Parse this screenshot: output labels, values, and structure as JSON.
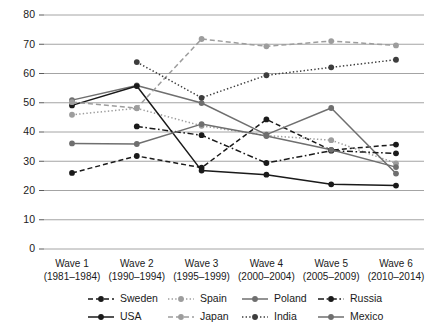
{
  "chart_data": {
    "type": "line",
    "title": "",
    "subtitle": "",
    "xlabel": "",
    "ylabel": "",
    "ylim": [
      0,
      80
    ],
    "ytick_step": 10,
    "yticks": [
      0,
      10,
      20,
      30,
      40,
      50,
      60,
      70,
      80
    ],
    "grid": "horizontal",
    "legend_position": "bottom",
    "categories": [
      "Wave 1",
      "Wave 2",
      "Wave 3",
      "Wave 4",
      "Wave 5",
      "Wave 6"
    ],
    "category_sublabels": [
      "(1981–1984)",
      "(1990–1994)",
      "(1995–1999)",
      "(2000–2004)",
      "(2005–2009)",
      "(2010–2014)"
    ],
    "series": [
      {
        "name": "Sweden",
        "color": "#1a1a1a",
        "dash": "dashed",
        "values": [
          26,
          31.8,
          27.8,
          44.3,
          33.8,
          35.7
        ]
      },
      {
        "name": "Spain",
        "color": "#9d9d9d",
        "dash": "dotted",
        "values": [
          45.9,
          48.1,
          42.1,
          38.8,
          37.2,
          29.3
        ]
      },
      {
        "name": "Poland",
        "color": "#6f6f6f",
        "dash": "solid",
        "values": [
          50.9,
          55.9,
          49.9,
          39.1,
          48.2,
          25.8
        ]
      },
      {
        "name": "Russia",
        "color": "#1a1a1a",
        "dash": "dashdot",
        "values": [
          null,
          41.9,
          38.9,
          29.4,
          33.6,
          32.7
        ]
      },
      {
        "name": "USA",
        "color": "#1a1a1a",
        "dash": "solid",
        "values": [
          49.1,
          55.7,
          26.8,
          25.4,
          22.1,
          21.7
        ]
      },
      {
        "name": "Japan",
        "color": "#9d9d9d",
        "dash": "dashed",
        "values": [
          50.2,
          48.2,
          71.8,
          69.3,
          71.1,
          69.6
        ]
      },
      {
        "name": "India",
        "color": "#3d3d3d",
        "dash": "dotted",
        "values": [
          null,
          63.9,
          51.7,
          59.4,
          62.1,
          64.7
        ]
      },
      {
        "name": "Mexico",
        "color": "#6f6f6f",
        "dash": "solid",
        "values": [
          36.1,
          35.9,
          42.7,
          38.6,
          33.9,
          28.0
        ]
      }
    ]
  },
  "legend": {
    "row1": [
      "Sweden",
      "Spain",
      "Poland",
      "Russia"
    ],
    "row2": [
      "USA",
      "Japan",
      "India",
      "Mexico"
    ]
  }
}
